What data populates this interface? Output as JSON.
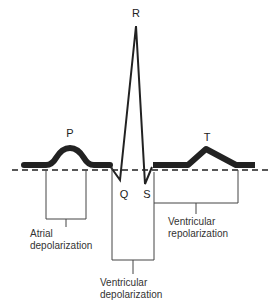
{
  "diagram": {
    "wave_labels": {
      "p": "P",
      "q": "Q",
      "r": "R",
      "s": "S",
      "t": "T"
    },
    "interval_labels": {
      "atrial_depolarization": [
        "Atrial",
        "depolarization"
      ],
      "ventricular_depolarization": [
        "Ventricular",
        "depolarization"
      ],
      "ventricular_repolarization": [
        "Ventricular",
        "repolarization"
      ]
    },
    "colors": {
      "waveform": "#222222",
      "baseline": "#222222",
      "brackets": "#444444",
      "text": "#333333",
      "background": "#ffffff"
    }
  }
}
